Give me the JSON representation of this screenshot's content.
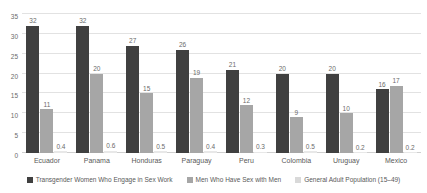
{
  "chart_data": {
    "type": "bar",
    "title": "",
    "subtitle": "",
    "xlabel": "",
    "ylabel": "",
    "ylim": [
      0,
      35
    ],
    "ytick_labels": [
      "0",
      "5",
      "10",
      "15",
      "20",
      "25",
      "30",
      "35"
    ],
    "ytick_values": [
      0,
      5,
      10,
      15,
      20,
      25,
      30,
      35
    ],
    "grid": true,
    "legend_position": "bottom",
    "categories": [
      "Ecuador",
      "Panama",
      "Honduras",
      "Paraguay",
      "Peru",
      "Colombia",
      "Uruguay",
      "Mexico"
    ],
    "series": [
      {
        "name": "Transgender Women Who Engage in Sex Work",
        "color": "#404040",
        "values": [
          32,
          32,
          27,
          26,
          21,
          20,
          20,
          16
        ],
        "labels": [
          "32",
          "32",
          "27",
          "26",
          "21",
          "20",
          "20",
          "16"
        ]
      },
      {
        "name": "Men Who Have Sex with Men",
        "color": "#a6a6a6",
        "values": [
          11,
          20,
          15,
          19,
          12,
          9,
          10,
          17
        ],
        "labels": [
          "11",
          "20",
          "15",
          "19",
          "12",
          "9",
          "10",
          "17"
        ]
      },
      {
        "name": "General Adult Population (15–49)",
        "color": "#e8e8e8",
        "values": [
          0.4,
          0.6,
          0.5,
          0.4,
          0.3,
          0.5,
          0.2,
          0.2
        ],
        "labels": [
          "0.4",
          "0.6",
          "0.5",
          "0.4",
          "0.3",
          "0.5",
          "0.2",
          "0.2"
        ]
      }
    ]
  }
}
